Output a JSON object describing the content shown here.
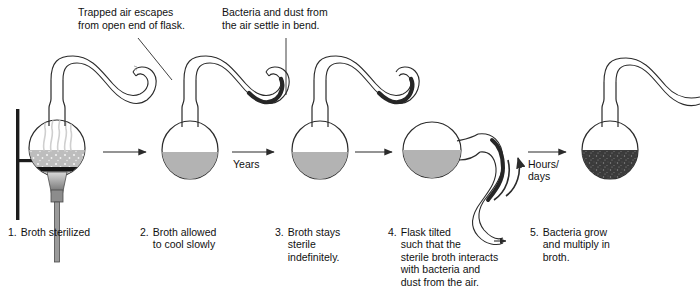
{
  "figure": {
    "colors": {
      "outline": "#2b2b2b",
      "broth_sterile": "#b3b3b3",
      "broth_contaminated": "#3a3a3a",
      "deposit": "#262626",
      "stand": "#1c1c1c",
      "burner": "#7d7d7d"
    }
  },
  "annotations": [
    {
      "id": "trapped-air",
      "text": "Trapped air escapes\nfrom open end of flask.",
      "x": 78,
      "y": 6
    },
    {
      "id": "bacteria-dust",
      "text": "Bacteria and dust from\nthe air settle in bend.",
      "x": 222,
      "y": 6
    }
  ],
  "step_labels": [
    {
      "id": "years",
      "text": "Years",
      "x": 233,
      "y": 158
    },
    {
      "id": "hours-days",
      "text": "Hours/\ndays",
      "x": 528,
      "y": 148
    }
  ],
  "captions": [
    {
      "num": "1.",
      "text": "Broth sterilized",
      "x": 8,
      "y": 226,
      "width": 124
    },
    {
      "num": "2.",
      "text": "Broth allowed\nto cool slowly",
      "x": 140,
      "y": 226,
      "width": 124
    },
    {
      "num": "3.",
      "text": "Broth stays\nsterile\nindefinitely.",
      "x": 275,
      "y": 226,
      "width": 108
    },
    {
      "num": "4.",
      "text": "Flask tilted\nsuch that the\nsterile broth interacts\nwith bacteria and\ndust from the air.",
      "x": 388,
      "y": 226,
      "width": 136
    },
    {
      "num": "5.",
      "text": "Bacteria grow\nand multiply in\nbroth.",
      "x": 530,
      "y": 226,
      "width": 130
    }
  ],
  "flasks": [
    {
      "id": "flask-1",
      "label": "sterilizing-flask",
      "cx": 57,
      "cy": 148,
      "broth": "boiling",
      "has_stand": true,
      "has_burner": true,
      "has_steam": true,
      "tilted": false
    },
    {
      "id": "flask-2",
      "label": "cooling-flask",
      "cx": 190,
      "cy": 148,
      "broth": "sterile",
      "has_stand": false,
      "has_burner": false,
      "has_steam": false,
      "tilted": false
    },
    {
      "id": "flask-3",
      "label": "sterile-flask",
      "cx": 320,
      "cy": 148,
      "broth": "sterile",
      "has_stand": false,
      "has_burner": false,
      "has_steam": false,
      "tilted": false
    },
    {
      "id": "flask-4",
      "label": "tilted-flask",
      "cx": 432,
      "cy": 148,
      "broth": "sterile",
      "has_stand": false,
      "has_burner": false,
      "has_steam": false,
      "tilted": true
    },
    {
      "id": "flask-5",
      "label": "contaminated-flask",
      "cx": 610,
      "cy": 148,
      "broth": "contaminated",
      "has_stand": false,
      "has_burner": false,
      "has_steam": false,
      "tilted": false
    }
  ],
  "arrows": [
    {
      "id": "arrow-1-2",
      "type": "straight",
      "from": 103,
      "to": 150,
      "y": 152
    },
    {
      "id": "arrow-2-3",
      "type": "straight",
      "from": 232,
      "to": 278,
      "y": 152
    },
    {
      "id": "arrow-3-4",
      "type": "straight",
      "from": 355,
      "to": 392,
      "y": 152
    },
    {
      "id": "arrow-4-5",
      "type": "straight",
      "from": 528,
      "to": 566,
      "y": 152
    },
    {
      "id": "arrow-rotate",
      "type": "curved",
      "cx": 512,
      "cy": 160
    }
  ]
}
